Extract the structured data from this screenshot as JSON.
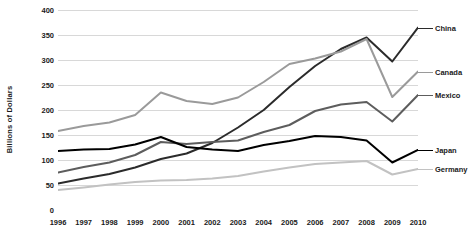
{
  "chart_data": {
    "type": "line",
    "title": "",
    "xlabel": "",
    "ylabel": "Billions of Dollars",
    "ylim": [
      0,
      400
    ],
    "yticks": [
      0,
      50,
      100,
      150,
      200,
      250,
      300,
      350,
      400
    ],
    "grid": true,
    "legend_position": "right",
    "categories": [
      "1996",
      "1997",
      "1998",
      "1999",
      "2000",
      "2001",
      "2002",
      "2003",
      "2004",
      "2005",
      "2006",
      "2007",
      "2008",
      "2009",
      "2010"
    ],
    "series": [
      {
        "name": "China",
        "color": "#2b2b2b",
        "values": [
          53,
          63,
          72,
          85,
          102,
          113,
          134,
          165,
          200,
          246,
          288,
          322,
          345,
          297,
          365
        ]
      },
      {
        "name": "Canada",
        "color": "#9a9a9a",
        "values": [
          158,
          168,
          175,
          190,
          235,
          218,
          212,
          225,
          256,
          292,
          303,
          317,
          342,
          226,
          277
        ]
      },
      {
        "name": "Mexico",
        "color": "#5d5d5d",
        "values": [
          75,
          86,
          95,
          110,
          136,
          132,
          136,
          139,
          156,
          170,
          198,
          211,
          216,
          177,
          230
        ]
      },
      {
        "name": "Japan",
        "color": "#000000",
        "values": [
          118,
          121,
          122,
          131,
          146,
          126,
          121,
          118,
          130,
          138,
          148,
          146,
          139,
          95,
          120
        ]
      },
      {
        "name": "Germany",
        "color": "#c2c2c2",
        "values": [
          40,
          45,
          51,
          56,
          59,
          60,
          63,
          68,
          77,
          85,
          92,
          95,
          98,
          71,
          82
        ]
      }
    ]
  }
}
